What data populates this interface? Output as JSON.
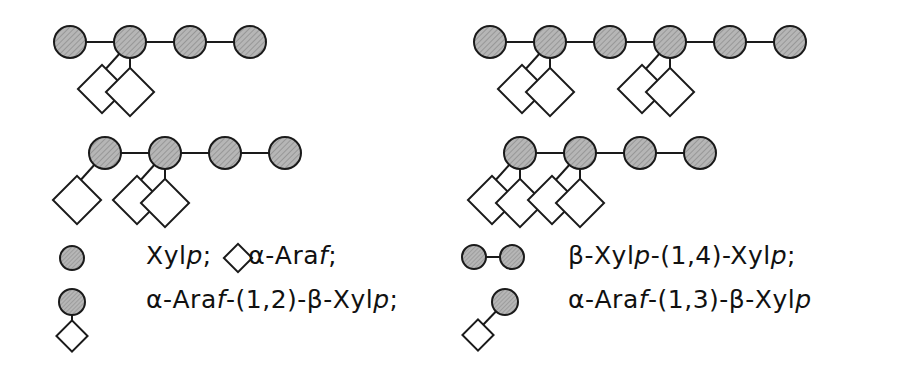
{
  "figure": {
    "background_color": "#ffffff",
    "line_color": "#1a1a1a",
    "circle_fill": "#b4b4b4",
    "circle_stroke": "#1a1a1a",
    "diamond_fill": "#ffffff",
    "diamond_stroke": "#1a1a1a",
    "symbols": {
      "circle_name": "xylopyranose-circle-symbol",
      "diamond_name": "arabinofuranose-diamond-symbol"
    }
  },
  "structures": [
    {
      "id": "structure-top-left",
      "label": "top-left structure",
      "backbone_units": 4,
      "backbone_symbol": "circle",
      "branches": [
        {
          "on_unit": 2,
          "symbol": "diamond",
          "attachment": "diagonal-left"
        },
        {
          "on_unit": 2,
          "symbol": "diamond",
          "attachment": "vertical"
        }
      ]
    },
    {
      "id": "structure-top-right",
      "label": "top-right structure",
      "backbone_units": 6,
      "backbone_symbol": "circle",
      "branches": [
        {
          "on_unit": 2,
          "symbol": "diamond",
          "attachment": "diagonal-left"
        },
        {
          "on_unit": 2,
          "symbol": "diamond",
          "attachment": "vertical"
        },
        {
          "on_unit": 4,
          "symbol": "diamond",
          "attachment": "diagonal-left"
        },
        {
          "on_unit": 4,
          "symbol": "diamond",
          "attachment": "vertical"
        }
      ]
    },
    {
      "id": "structure-bottom-left",
      "label": "bottom-left structure",
      "backbone_units": 4,
      "backbone_symbol": "circle",
      "branches": [
        {
          "on_unit": 1,
          "symbol": "diamond",
          "attachment": "diagonal-left"
        },
        {
          "on_unit": 2,
          "symbol": "diamond",
          "attachment": "diagonal-left"
        },
        {
          "on_unit": 2,
          "symbol": "diamond",
          "attachment": "vertical"
        }
      ]
    },
    {
      "id": "structure-bottom-right",
      "label": "bottom-right structure",
      "backbone_units": 4,
      "backbone_symbol": "circle",
      "branches": [
        {
          "on_unit": 1,
          "symbol": "diamond",
          "attachment": "diagonal-left"
        },
        {
          "on_unit": 1,
          "symbol": "diamond",
          "attachment": "vertical"
        },
        {
          "on_unit": 2,
          "symbol": "diamond",
          "attachment": "diagonal-left"
        },
        {
          "on_unit": 2,
          "symbol": "diamond",
          "attachment": "vertical"
        }
      ]
    }
  ],
  "legend": {
    "left_column": [
      {
        "id": "legend-item-xylp-araf",
        "icon": "circle-and-diamond-key",
        "segments": [
          {
            "t": "Xyl",
            "i": false
          },
          {
            "t": "p",
            "i": true
          },
          {
            "t": ";",
            "i": false
          }
        ],
        "plain_text": "Xylp;  ◇ α-Araf;"
      },
      {
        "id": "legend-item-araf-1-2-xylp",
        "icon": "circle-over-diamond-icon",
        "plain_text": "α-Araf-(1,2)-β-Xylp;"
      }
    ],
    "right_column": [
      {
        "id": "legend-item-xylp-1-4-xylp",
        "icon": "two-linked-circles-icon",
        "plain_text": "β-Xylp-(1,4)-Xylp;"
      },
      {
        "id": "legend-item-araf-1-3-xylp",
        "icon": "diagonal-diamond-circle-icon",
        "plain_text": "α-Araf-(1,3)-β-Xylp"
      }
    ],
    "line1": {
      "pre_circle_label_a": "Xyl",
      "italic_a": "p",
      "sep_a": "; ",
      "diamond_glyph": "◇",
      "label_b": " α-Ara",
      "italic_b": "f",
      "sep_b": ";"
    },
    "line2": {
      "a": "α-Ara",
      "ia": "f",
      "b": "-(1,2)-β-Xyl",
      "ib": "p",
      "c": ";"
    },
    "line3": {
      "a": "β-Xyl",
      "ia": "p",
      "b": "-(1,4)-Xyl",
      "ib": "p",
      "c": ";"
    },
    "line4": {
      "a": "α-Ara",
      "ia": "f",
      "b": "-(1,3)-β-Xyl",
      "ib": "p",
      "c": ""
    }
  }
}
